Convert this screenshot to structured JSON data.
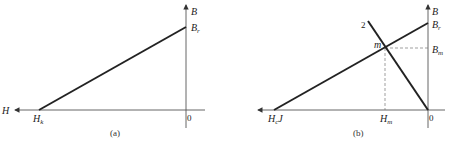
{
  "figure": {
    "panels": [
      {
        "id": "a",
        "caption": "(a)",
        "labels": {
          "b_axis": "B",
          "br": {
            "main": "B",
            "sub": "r"
          },
          "h_axis": "H",
          "hk": {
            "main": "H",
            "sub": "k"
          },
          "origin": "0"
        },
        "lines": [
          {
            "name": "demagnetization-line",
            "from": "H_k",
            "to": "B_r"
          }
        ]
      },
      {
        "id": "b",
        "caption": "(b)",
        "labels": {
          "b_axis": "B",
          "br": {
            "main": "B",
            "sub": "r"
          },
          "bm": {
            "main": "B",
            "sub": "m"
          },
          "hcj": {
            "main": "H",
            "sub": "c",
            "suffix": "J"
          },
          "hm": {
            "main": "H",
            "sub": "m"
          },
          "origin": "0",
          "line2": "2",
          "point_m": "m"
        },
        "lines": [
          {
            "name": "demagnetization-line",
            "from": "H_cJ",
            "to": "B_r"
          },
          {
            "name": "load-line-2",
            "from": "0",
            "to": "2"
          }
        ],
        "operating_point": {
          "label": "m",
          "b": "B_m",
          "h": "H_m"
        }
      }
    ],
    "colors": {
      "line": "#222222",
      "axis": "#555555",
      "dashed": "#777777"
    }
  }
}
